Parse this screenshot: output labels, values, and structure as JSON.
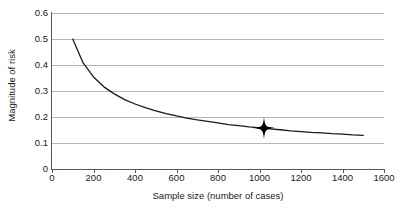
{
  "chart_data": {
    "type": "line",
    "title": "",
    "xlabel": "Sample size (number of cases)",
    "ylabel": "Magnitude of risk",
    "xlim": [
      0,
      1600
    ],
    "ylim": [
      0,
      0.6
    ],
    "grid": true,
    "legend": null,
    "xticks": [
      0,
      200,
      400,
      600,
      800,
      1000,
      1200,
      1400,
      1600
    ],
    "xtick_labels": [
      "0",
      "200",
      "400",
      "600",
      "800",
      "1000",
      "1200",
      "1400",
      "1600"
    ],
    "yticks": [
      0,
      0.1,
      0.2,
      0.3,
      0.4,
      0.5,
      0.6
    ],
    "ytick_labels": [
      "0",
      "0.1",
      "0.2",
      "0.3",
      "0.4",
      "0.5",
      "0.6"
    ],
    "series": [
      {
        "name": "magnitude-of-risk-curve",
        "color": "#1a1a1a",
        "relation": "y = 5 / sqrt(x)",
        "x": [
          100,
          150,
          200,
          250,
          300,
          350,
          400,
          450,
          500,
          550,
          600,
          650,
          700,
          750,
          800,
          850,
          900,
          950,
          1000,
          1050,
          1100,
          1150,
          1200,
          1250,
          1300,
          1350,
          1400,
          1450,
          1500
        ],
        "values": [
          0.5,
          0.408,
          0.354,
          0.316,
          0.289,
          0.267,
          0.25,
          0.236,
          0.224,
          0.213,
          0.204,
          0.196,
          0.189,
          0.183,
          0.177,
          0.171,
          0.167,
          0.162,
          0.158,
          0.154,
          0.151,
          0.147,
          0.144,
          0.141,
          0.139,
          0.136,
          0.134,
          0.131,
          0.129
        ]
      }
    ],
    "annotations": [
      {
        "name": "highlighted-point",
        "marker": "four-pointed-star",
        "x": 1020,
        "y": 0.157,
        "color": "#000000"
      }
    ]
  },
  "axes": {
    "y_title": "Magnitude of risk",
    "x_title": "Sample size (number of cases)"
  },
  "colors": {
    "grid": "#b5b5b5",
    "axis": "#595959",
    "curve": "#1a1a1a",
    "marker": "#000000",
    "background": "#ffffff",
    "text": "#1a1a1a"
  }
}
